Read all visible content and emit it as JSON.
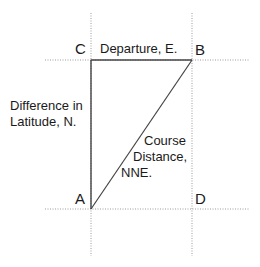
{
  "diagram": {
    "points": {
      "A": "A",
      "B": "B",
      "C": "C",
      "D": "D"
    },
    "labels": {
      "departure": "Departure, E.",
      "difference_line1": "Difference in",
      "difference_line2": "Latitude, N.",
      "course_line1": "Course",
      "course_line2": "Distance,",
      "course_line3": "NNE."
    },
    "colors": {
      "solid_line": "#444444",
      "dotted_line": "#9a9a9a",
      "text": "#1a1a1a"
    }
  }
}
